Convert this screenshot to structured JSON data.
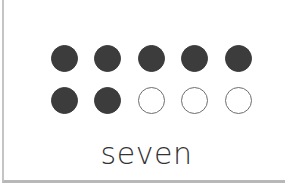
{
  "card": {
    "total_dots": 10,
    "filled_count": 7,
    "label": "seven",
    "colors": {
      "filled": "#3c3c3c",
      "empty_stroke": "#6e6e6e",
      "border": "#c4c4c4"
    }
  },
  "rows": [
    {
      "dots": [
        "filled",
        "filled",
        "filled",
        "filled",
        "filled"
      ]
    },
    {
      "dots": [
        "filled",
        "filled",
        "empty",
        "empty",
        "empty"
      ]
    }
  ]
}
